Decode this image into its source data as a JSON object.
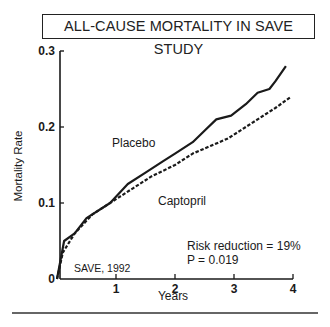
{
  "title": "ALL-CAUSE MORTALITY IN SAVE STUDY",
  "annotations": {
    "source": "SAVE, 1992",
    "risk_reduction": "Risk reduction = 19%",
    "p_value": "P = 0.019"
  },
  "chart_data": {
    "type": "line",
    "title": "ALL-CAUSE MORTALITY IN SAVE STUDY",
    "xlabel": "Years",
    "ylabel": "Mortality Rate",
    "xlim": [
      0,
      4
    ],
    "ylim": [
      0,
      0.3
    ],
    "x_ticks": [
      "1",
      "2",
      "3",
      "4"
    ],
    "y_ticks": [
      "0",
      "0.1",
      "0.2",
      "0.3"
    ],
    "grid": false,
    "legend": "inline labels",
    "series": [
      {
        "name": "Placebo",
        "style": "solid",
        "x": [
          0,
          0.12,
          0.3,
          0.5,
          0.9,
          1.2,
          1.5,
          1.8,
          2.0,
          2.3,
          2.5,
          2.7,
          2.95,
          3.2,
          3.4,
          3.6,
          3.7,
          3.88
        ],
        "y": [
          0,
          0.05,
          0.06,
          0.08,
          0.1,
          0.125,
          0.14,
          0.155,
          0.165,
          0.18,
          0.195,
          0.21,
          0.215,
          0.23,
          0.245,
          0.25,
          0.26,
          0.28
        ]
      },
      {
        "name": "Captopril",
        "style": "dashed",
        "x": [
          0,
          0.1,
          0.3,
          0.6,
          1.0,
          1.3,
          1.6,
          2.0,
          2.3,
          2.6,
          2.9,
          3.1,
          3.4,
          3.7,
          3.97
        ],
        "y": [
          0,
          0.035,
          0.06,
          0.085,
          0.105,
          0.12,
          0.135,
          0.15,
          0.165,
          0.175,
          0.185,
          0.195,
          0.21,
          0.225,
          0.24
        ]
      }
    ],
    "annotations": [
      "SAVE, 1992",
      "Risk reduction = 19%",
      "P = 0.019"
    ]
  }
}
